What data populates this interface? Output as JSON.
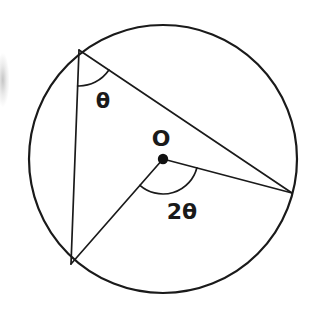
{
  "figure": {
    "background_color": "#ffffff",
    "stroke_color": "#1a1a1a",
    "circle": {
      "name": "circle-outline",
      "center": {
        "x": 163,
        "y": 159
      },
      "radius": 134,
      "stroke_width": 2.2
    },
    "center_point": {
      "name": "center-point-dot",
      "x": 163,
      "y": 159,
      "radius": 5.2,
      "label": "O",
      "label_x": 161,
      "label_y": 146,
      "label_font_size": 22
    },
    "vertices": [
      {
        "id": "A",
        "name": "vertex-top-left",
        "x": 79,
        "y": 50
      },
      {
        "id": "B",
        "name": "vertex-bottom-left",
        "x": 71,
        "y": 264
      },
      {
        "id": "C",
        "name": "vertex-right",
        "x": 292,
        "y": 193
      }
    ],
    "chords": [
      {
        "name": "chord-a-b",
        "from": "A",
        "to": "B",
        "stroke_width": 1.7
      },
      {
        "name": "chord-a-c",
        "from": "A",
        "to": "C",
        "stroke_width": 1.7
      }
    ],
    "radii": [
      {
        "name": "radius-o-b",
        "from": "O",
        "to": "B",
        "stroke_width": 1.7
      },
      {
        "name": "radius-o-c",
        "from": "O",
        "to": "C",
        "stroke_width": 1.7
      }
    ],
    "angles": [
      {
        "name": "inscribed-angle-theta",
        "vertex": "A",
        "label": "θ",
        "label_x": 103,
        "label_y": 108,
        "label_font_size": 21,
        "arc_radius": 36,
        "arc_stroke_width": 1.7,
        "arc_path": "M 76.0 86.0 A 36 36 0 0 0 111.9 81.5"
      },
      {
        "name": "central-angle-two-theta",
        "vertex": "O",
        "label": "2θ",
        "label_x": 182,
        "label_y": 219,
        "label_font_size": 22,
        "arc_radius": 35,
        "arc_stroke_width": 1.7,
        "arc_path": "M 149.3 171.2 A 35 35 0 0 0 197.9 168.1"
      }
    ],
    "artifacts": [
      {
        "name": "scan-smudge-left-edge",
        "x": 0,
        "y": 46,
        "width": 14,
        "height": 68,
        "color": "#d8d8d8"
      }
    ]
  }
}
